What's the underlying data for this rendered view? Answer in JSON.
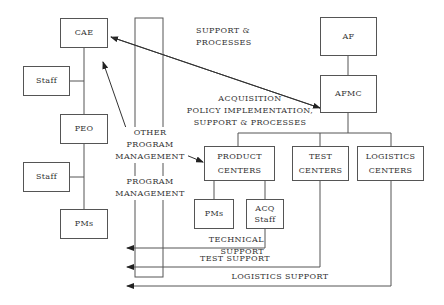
{
  "diagram": {
    "boxes": {
      "cae": "CAE",
      "staff1": "Staff",
      "peo": "PEO",
      "staff2": "Staff",
      "pms_left": "PMs",
      "af": "AF",
      "afmc": "AFMC",
      "product_centers": "PRODUCT CENTERS",
      "test_centers": "TEST CENTERS",
      "logistics_centers": "LOGISTICS CENTERS",
      "pms_pc": "PMs",
      "acq_staff": "ACQ Staff"
    },
    "labels": {
      "support_processes_1": "SUPPORT &",
      "support_processes_2": "PROCESSES",
      "acq_1": "ACQUISITION",
      "acq_2": "POLICY IMPLEMENTATION,",
      "acq_3": "SUPPORT & PROCESSES",
      "other_1": "OTHER",
      "other_2": "PROGRAM",
      "other_3": "MANAGEMENT",
      "pm_1": "PROGRAM",
      "pm_2": "MANAGEMENT",
      "technical_support": "TECHNICAL SUPPORT",
      "test_support": "TEST SUPPORT",
      "logistics_support": "LOGISTICS SUPPORT"
    }
  }
}
